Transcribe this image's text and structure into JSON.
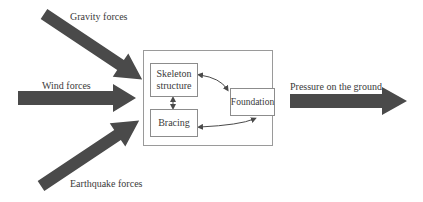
{
  "diagram": {
    "type": "block-flow",
    "inputs": [
      {
        "id": "gravity",
        "label": "Gravity forces",
        "direction": "diagonal-down"
      },
      {
        "id": "wind",
        "label": "Wind forces",
        "direction": "horizontal"
      },
      {
        "id": "earthquake",
        "label": "Earthquake forces",
        "direction": "diagonal-up"
      }
    ],
    "system": {
      "blocks": [
        {
          "id": "skeleton",
          "label_line1": "Skeleton",
          "label_line2": "structure"
        },
        {
          "id": "bracing",
          "label": "Bracing"
        },
        {
          "id": "foundation",
          "label": "Foundation"
        }
      ],
      "connections": [
        {
          "from": "skeleton",
          "to": "bracing",
          "bidirectional": true
        },
        {
          "from": "skeleton",
          "to": "foundation",
          "bidirectional": true
        },
        {
          "from": "bracing",
          "to": "foundation",
          "bidirectional": true
        }
      ]
    },
    "output": {
      "id": "pressure",
      "label": "Pressure on the ground"
    },
    "colors": {
      "arrow_fill": "#4a4a4a",
      "box_border": "#8c8c8c",
      "text": "#3a3a3a"
    }
  }
}
